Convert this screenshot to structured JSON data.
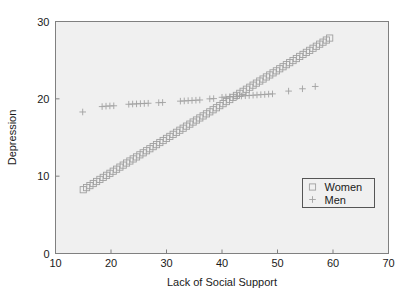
{
  "chart_data": {
    "type": "scatter",
    "title": "",
    "xlabel": "Lack of Social Support",
    "ylabel": "Depression",
    "xlim": [
      10,
      70
    ],
    "ylim": [
      0,
      30
    ],
    "xticks": [
      10,
      20,
      30,
      40,
      50,
      60,
      70
    ],
    "yticks": [
      0,
      10,
      20,
      30
    ],
    "xtick_labels": [
      "10",
      "20",
      "30",
      "40",
      "50",
      "60",
      "70"
    ],
    "ytick_labels": [
      "0",
      "10",
      "20",
      "30"
    ],
    "grid": false,
    "legend_position": "lower right",
    "background_color": "#f0f0f0",
    "axis_color": "#808080",
    "marker_color": "#a0a0a0",
    "series": [
      {
        "name": "Women",
        "marker": "square",
        "x": [
          15.0,
          15.6,
          16.2,
          16.8,
          17.4,
          18.0,
          18.6,
          19.2,
          19.8,
          20.4,
          21.0,
          21.6,
          22.2,
          22.8,
          23.4,
          24.0,
          24.6,
          25.2,
          25.8,
          26.4,
          27.0,
          27.6,
          28.2,
          28.8,
          29.4,
          30.0,
          30.6,
          31.2,
          31.8,
          32.4,
          33.0,
          33.6,
          34.2,
          34.8,
          35.4,
          36.0,
          36.6,
          37.2,
          37.8,
          38.4,
          39.0,
          39.6,
          40.2,
          40.8,
          41.4,
          42.0,
          42.6,
          43.2,
          43.8,
          44.4,
          45.0,
          45.6,
          46.2,
          46.8,
          47.4,
          48.0,
          48.6,
          49.2,
          49.8,
          50.4,
          51.0,
          51.6,
          52.2,
          52.8,
          53.4,
          54.0,
          54.6,
          55.2,
          55.8,
          56.4,
          57.0,
          57.6,
          58.2,
          58.8,
          59.4
        ],
        "y": [
          8.25,
          8.52,
          8.78,
          9.05,
          9.31,
          9.58,
          9.84,
          10.11,
          10.37,
          10.64,
          10.9,
          11.17,
          11.43,
          11.7,
          11.96,
          12.23,
          12.49,
          12.76,
          13.02,
          13.29,
          13.55,
          13.82,
          14.08,
          14.35,
          14.61,
          14.88,
          15.14,
          15.41,
          15.67,
          15.94,
          16.2,
          16.47,
          16.73,
          17.0,
          17.26,
          17.53,
          17.79,
          18.06,
          18.32,
          18.59,
          18.85,
          19.12,
          19.38,
          19.65,
          19.91,
          20.18,
          20.44,
          20.71,
          20.97,
          21.24,
          21.5,
          21.77,
          22.03,
          22.3,
          22.56,
          22.83,
          23.09,
          23.36,
          23.62,
          23.89,
          24.15,
          24.42,
          24.68,
          24.95,
          25.21,
          25.48,
          25.74,
          26.01,
          26.27,
          26.54,
          26.8,
          27.07,
          27.33,
          27.6,
          27.86
        ]
      },
      {
        "name": "Men",
        "marker": "plus",
        "x": [
          14.9,
          18.4,
          19.1,
          19.8,
          20.5,
          23.2,
          23.9,
          24.6,
          25.3,
          26.0,
          26.7,
          28.6,
          29.3,
          32.5,
          33.2,
          33.9,
          34.6,
          35.3,
          36.0,
          37.8,
          38.5,
          40.0,
          40.7,
          41.4,
          42.1,
          42.8,
          43.5,
          44.2,
          44.9,
          45.6,
          46.3,
          47.0,
          47.7,
          48.4,
          49.1,
          52.0,
          54.5,
          56.8
        ],
        "y": [
          18.3,
          19.0,
          19.05,
          19.08,
          19.1,
          19.3,
          19.33,
          19.35,
          19.38,
          19.4,
          19.43,
          19.5,
          19.53,
          19.7,
          19.73,
          19.76,
          19.79,
          19.82,
          19.85,
          20.0,
          20.03,
          20.2,
          20.23,
          20.26,
          20.29,
          20.33,
          20.36,
          20.4,
          20.43,
          20.47,
          20.5,
          20.54,
          20.57,
          20.61,
          20.64,
          21.0,
          21.3,
          21.6
        ]
      }
    ],
    "legend_entries": [
      {
        "label": "Women",
        "marker": "square"
      },
      {
        "label": "Men",
        "marker": "plus"
      }
    ]
  }
}
